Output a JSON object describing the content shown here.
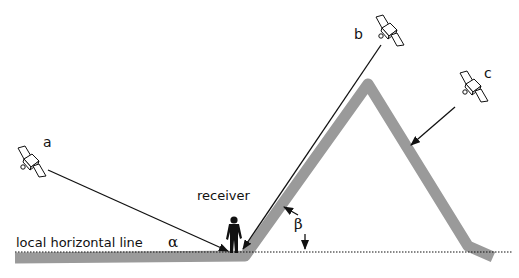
{
  "diagram": {
    "labels": {
      "satellite_a": "a",
      "satellite_b": "b",
      "satellite_c": "c",
      "receiver": "receiver",
      "horizon": "local horizontal line",
      "alpha": "α",
      "beta": "β"
    },
    "colors": {
      "terrain": "#9a9a9a",
      "line": "#111111",
      "background": "#ffffff"
    }
  }
}
